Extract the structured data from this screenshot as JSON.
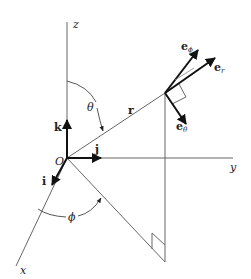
{
  "diagram": {
    "type": "spherical-coordinates",
    "axes": {
      "z_label": "z",
      "y_label": "y",
      "x_label": "x"
    },
    "origin_label": "O",
    "unit_vectors": {
      "i": "i",
      "j": "j",
      "k": "k"
    },
    "position_vector_label": "r",
    "angles": {
      "theta": "θ",
      "phi": "ϕ"
    },
    "basis": {
      "e": "e",
      "r_sub": "r",
      "theta_sub": "θ",
      "phi_sub": "ϕ"
    },
    "colors": {
      "line": "#555555",
      "arrow": "#111111"
    }
  }
}
